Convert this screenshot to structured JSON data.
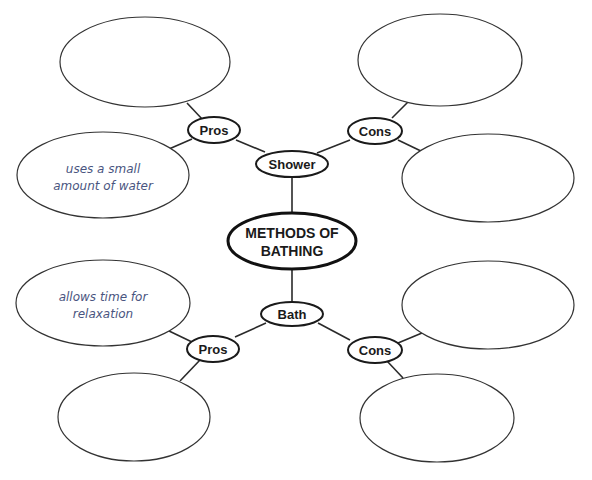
{
  "diagram": {
    "title": "METHODS OF BATHING",
    "title_lines": [
      "METHODS OF",
      "BATHING"
    ],
    "branches": {
      "shower": {
        "label": "Shower",
        "pros": {
          "label": "Pros",
          "notes": [
            [
              "uses a small",
              "amount of water"
            ],
            []
          ]
        },
        "cons": {
          "label": "Cons",
          "notes": [
            [],
            []
          ]
        }
      },
      "bath": {
        "label": "Bath",
        "pros": {
          "label": "Pros",
          "notes": [
            [
              "allows time for",
              "relaxation"
            ],
            []
          ]
        },
        "cons": {
          "label": "Cons",
          "notes": [
            [],
            []
          ]
        }
      }
    }
  },
  "colors": {
    "line": "#2a2a2a",
    "handwriting": "#4a5580",
    "background": "#ffffff"
  }
}
